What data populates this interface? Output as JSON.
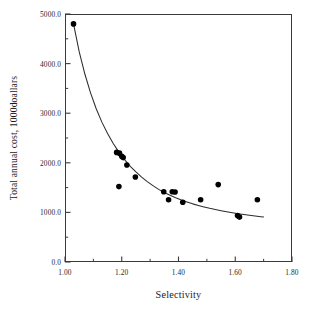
{
  "chart_data": {
    "type": "scatter",
    "title": "",
    "xlabel": "Selectivity",
    "ylabel": "Total annual cost, 1000doallars",
    "xlim": [
      1.0,
      1.8
    ],
    "ylim": [
      0.0,
      5000.0
    ],
    "grid": false,
    "legend": null,
    "x_ticks": [
      "1.00",
      "1.20",
      "1.40",
      "1.60",
      "1.80"
    ],
    "x_tick_values": [
      1.0,
      1.2,
      1.4,
      1.6,
      1.8
    ],
    "x_minor_tick_values": [
      1.1,
      1.3,
      1.5,
      1.7
    ],
    "y_ticks": [
      "0.0",
      "1000.0",
      "2000.0",
      "3000.0",
      "4000.0",
      "5000.0"
    ],
    "y_tick_values": [
      0,
      1000,
      2000,
      3000,
      4000,
      5000
    ],
    "y_minor_tick_values": [
      500,
      1500,
      2500,
      3500,
      4500
    ],
    "marker": {
      "shape": "filled-circle",
      "color": "#000000",
      "size_px": 5.6
    },
    "series": [
      {
        "name": "Total annual cost vs selectivity",
        "type": "scatter",
        "points": [
          {
            "x": 1.03,
            "y": 4800
          },
          {
            "x": 1.182,
            "y": 2210
          },
          {
            "x": 1.192,
            "y": 2195
          },
          {
            "x": 1.2,
            "y": 2130
          },
          {
            "x": 1.205,
            "y": 2105
          },
          {
            "x": 1.19,
            "y": 1520
          },
          {
            "x": 1.218,
            "y": 1955
          },
          {
            "x": 1.248,
            "y": 1715
          },
          {
            "x": 1.348,
            "y": 1415
          },
          {
            "x": 1.365,
            "y": 1255
          },
          {
            "x": 1.378,
            "y": 1415
          },
          {
            "x": 1.388,
            "y": 1410
          },
          {
            "x": 1.415,
            "y": 1205
          },
          {
            "x": 1.478,
            "y": 1255
          },
          {
            "x": 1.54,
            "y": 1560
          },
          {
            "x": 1.608,
            "y": 935
          },
          {
            "x": 1.615,
            "y": 905
          },
          {
            "x": 1.678,
            "y": 1255
          }
        ]
      },
      {
        "name": "fitted curve",
        "type": "line",
        "color": "#2d2d2d",
        "points": [
          {
            "x": 1.03,
            "y": 4800
          },
          {
            "x": 1.05,
            "y": 4240
          },
          {
            "x": 1.07,
            "y": 3790
          },
          {
            "x": 1.09,
            "y": 3410
          },
          {
            "x": 1.11,
            "y": 3090
          },
          {
            "x": 1.13,
            "y": 2820
          },
          {
            "x": 1.15,
            "y": 2590
          },
          {
            "x": 1.17,
            "y": 2390
          },
          {
            "x": 1.19,
            "y": 2215
          },
          {
            "x": 1.21,
            "y": 2065
          },
          {
            "x": 1.23,
            "y": 1930
          },
          {
            "x": 1.25,
            "y": 1815
          },
          {
            "x": 1.27,
            "y": 1710
          },
          {
            "x": 1.29,
            "y": 1620
          },
          {
            "x": 1.31,
            "y": 1540
          },
          {
            "x": 1.33,
            "y": 1465
          },
          {
            "x": 1.35,
            "y": 1400
          },
          {
            "x": 1.37,
            "y": 1345
          },
          {
            "x": 1.39,
            "y": 1295
          },
          {
            "x": 1.41,
            "y": 1250
          },
          {
            "x": 1.43,
            "y": 1210
          },
          {
            "x": 1.45,
            "y": 1172
          },
          {
            "x": 1.47,
            "y": 1140
          },
          {
            "x": 1.49,
            "y": 1110
          },
          {
            "x": 1.51,
            "y": 1082
          },
          {
            "x": 1.53,
            "y": 1058
          },
          {
            "x": 1.55,
            "y": 1034
          },
          {
            "x": 1.57,
            "y": 1012
          },
          {
            "x": 1.59,
            "y": 992
          },
          {
            "x": 1.61,
            "y": 974
          },
          {
            "x": 1.63,
            "y": 957
          },
          {
            "x": 1.65,
            "y": 941
          },
          {
            "x": 1.67,
            "y": 927
          },
          {
            "x": 1.69,
            "y": 914
          },
          {
            "x": 1.7,
            "y": 908
          }
        ]
      }
    ]
  }
}
